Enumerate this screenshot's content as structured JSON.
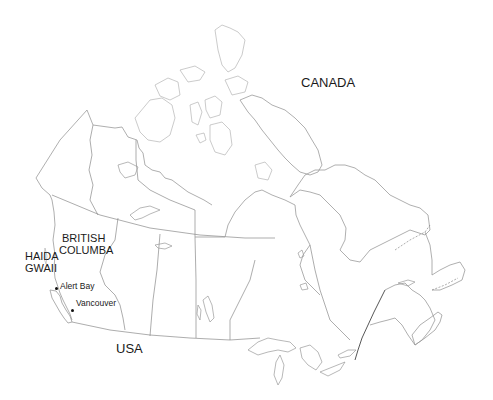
{
  "map": {
    "country_label": "CANADA",
    "neighbor_label": "USA",
    "province_label": {
      "line1": "BRITISH",
      "line2": "COLUMBA"
    },
    "island_label": {
      "line1": "HAIDA",
      "line2": "GWAII"
    },
    "cities": [
      {
        "name": "Alert Bay"
      },
      {
        "name": "Vancouver"
      }
    ],
    "colors": {
      "outline": "#9a9a9a",
      "text": "#1a1a1a",
      "background": "#ffffff"
    }
  }
}
